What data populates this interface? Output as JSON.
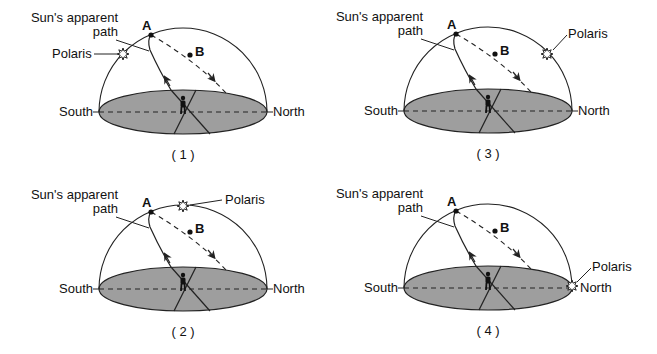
{
  "figure": {
    "type": "multiple-choice diagram",
    "ground_color": "#9e9e9e",
    "line_color": "#222222",
    "panels": [
      {
        "id": "1",
        "caption": "( 1 )",
        "path_label_line1": "Sun's apparent",
        "path_label_line2": "path",
        "polaris_label": "Polaris",
        "polaris_position": "low in southern sky (left side of dome)",
        "point_a": "A",
        "point_b": "B",
        "south_label": "South",
        "north_label": "North"
      },
      {
        "id": "2",
        "caption": "( 2 )",
        "path_label_line1": "Sun's apparent",
        "path_label_line2": "path",
        "polaris_label": "Polaris",
        "polaris_position": "at zenith (top of dome)",
        "point_a": "A",
        "point_b": "B",
        "south_label": "South",
        "north_label": "North"
      },
      {
        "id": "3",
        "caption": "( 3 )",
        "path_label_line1": "Sun's apparent",
        "path_label_line2": "path",
        "polaris_label": "Polaris",
        "polaris_position": "in northern sky (right side of dome)",
        "point_a": "A",
        "point_b": "B",
        "south_label": "South",
        "north_label": "North"
      },
      {
        "id": "4",
        "caption": "( 4 )",
        "path_label_line1": "Sun's apparent",
        "path_label_line2": "path",
        "polaris_label": "Polaris",
        "polaris_position": "on northern horizon",
        "point_a": "A",
        "point_b": "B",
        "south_label": "South",
        "north_label": "North"
      }
    ]
  }
}
